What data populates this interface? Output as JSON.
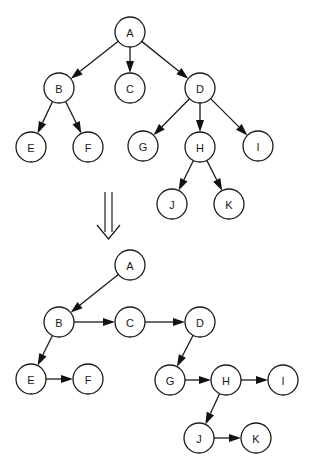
{
  "diagram": {
    "colors": {
      "stroke": "#1a1a1a",
      "fill": "#ffffff",
      "arrow": "#111111"
    },
    "original_tree": {
      "nodes": [
        "A",
        "B",
        "C",
        "D",
        "E",
        "F",
        "G",
        "H",
        "I",
        "J",
        "K"
      ],
      "edges": [
        [
          "A",
          "B"
        ],
        [
          "A",
          "C"
        ],
        [
          "A",
          "D"
        ],
        [
          "B",
          "E"
        ],
        [
          "B",
          "F"
        ],
        [
          "D",
          "G"
        ],
        [
          "D",
          "H"
        ],
        [
          "D",
          "I"
        ],
        [
          "H",
          "J"
        ],
        [
          "H",
          "K"
        ]
      ]
    },
    "transform_arrow": {
      "icon": "double-down-arrow-icon"
    },
    "binary_tree": {
      "nodes": [
        "A",
        "B",
        "C",
        "D",
        "E",
        "F",
        "G",
        "H",
        "I",
        "J",
        "K"
      ],
      "edges": [
        [
          "A",
          "B"
        ],
        [
          "B",
          "C"
        ],
        [
          "C",
          "D"
        ],
        [
          "B",
          "E"
        ],
        [
          "E",
          "F"
        ],
        [
          "D",
          "G"
        ],
        [
          "G",
          "H"
        ],
        [
          "H",
          "I"
        ],
        [
          "H",
          "J"
        ],
        [
          "J",
          "K"
        ]
      ]
    }
  }
}
